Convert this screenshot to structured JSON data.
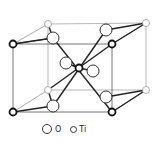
{
  "figure": {
    "legend": [
      {
        "symbol": "large-open-circle",
        "label": "O"
      },
      {
        "symbol": "small-open-circle",
        "label": "Ti"
      }
    ]
  },
  "colors": {
    "line": "#333333",
    "light_line": "#888888",
    "background": "#ffffff"
  }
}
